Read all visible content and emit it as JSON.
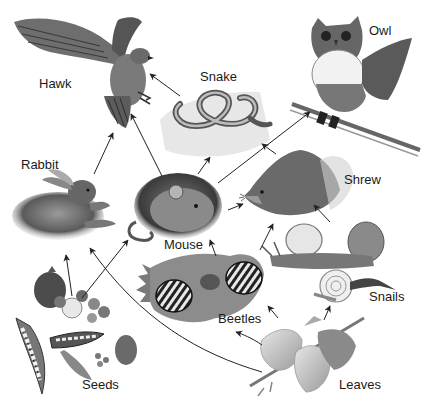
{
  "diagram": {
    "type": "food web",
    "colors": {
      "background": "#ffffff",
      "ink": "#1a1a1a",
      "arrow": "#222222"
    },
    "organisms": [
      {
        "id": "hawk",
        "label": "Hawk",
        "icon": "hawk-illustration"
      },
      {
        "id": "snake",
        "label": "Snake",
        "icon": "snake-illustration"
      },
      {
        "id": "owl",
        "label": "Owl",
        "icon": "owl-illustration"
      },
      {
        "id": "rabbit",
        "label": "Rabbit",
        "icon": "rabbit-illustration"
      },
      {
        "id": "mouse",
        "label": "Mouse",
        "icon": "mouse-illustration"
      },
      {
        "id": "shrew",
        "label": "Shrew",
        "icon": "shrew-illustration"
      },
      {
        "id": "beetles",
        "label": "Beetles",
        "icon": "beetles-illustration"
      },
      {
        "id": "snails",
        "label": "Snails",
        "icon": "snails-illustration"
      },
      {
        "id": "seeds",
        "label": "Seeds",
        "icon": "seeds-illustration"
      },
      {
        "id": "leaves",
        "label": "Leaves",
        "icon": "leaves-illustration"
      }
    ],
    "edges": [
      {
        "from": "snake",
        "to": "hawk"
      },
      {
        "from": "rabbit",
        "to": "hawk"
      },
      {
        "from": "mouse",
        "to": "hawk"
      },
      {
        "from": "mouse",
        "to": "snake"
      },
      {
        "from": "mouse",
        "to": "owl"
      },
      {
        "from": "shrew",
        "to": "snake"
      },
      {
        "from": "mouse",
        "to": "shrew"
      },
      {
        "from": "beetles",
        "to": "mouse"
      },
      {
        "from": "beetles",
        "to": "shrew"
      },
      {
        "from": "snails",
        "to": "shrew"
      },
      {
        "from": "seeds",
        "to": "rabbit"
      },
      {
        "from": "seeds",
        "to": "mouse"
      },
      {
        "from": "leaves",
        "to": "rabbit"
      },
      {
        "from": "leaves",
        "to": "beetles"
      },
      {
        "from": "leaves",
        "to": "snails"
      }
    ]
  }
}
